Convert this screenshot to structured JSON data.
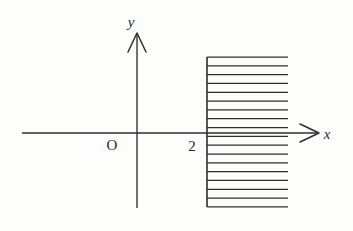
{
  "figure": {
    "background_color": "#fdfdfc",
    "ink_color": "#2e2e2e"
  },
  "labels": {
    "x_axis": "x",
    "y_axis": "y",
    "origin": "O",
    "x_intercept": "2"
  },
  "chart_data": {
    "type": "line",
    "title": "",
    "subtitle": "",
    "xlabel": "x",
    "ylabel": "y",
    "grid": false,
    "legend": null,
    "xlim": [
      -6,
      10
    ],
    "ylim": [
      -5,
      6
    ],
    "annotations": [
      {
        "text": "O",
        "x": -0.8,
        "y": -0.7,
        "role": "origin-label"
      },
      {
        "text": "2",
        "x": 1.5,
        "y": -0.6,
        "role": "x-intercept-label"
      },
      {
        "text": "x",
        "x": 9.4,
        "y": 0.55,
        "role": "x-axis-label"
      },
      {
        "text": "y",
        "x": -0.3,
        "y": 5.6,
        "role": "y-axis-label"
      }
    ],
    "axes": [
      {
        "name": "x-axis",
        "from": [
          -6.0,
          0
        ],
        "to": [
          9.0,
          0
        ],
        "arrow": "end"
      },
      {
        "name": "y-axis",
        "from": [
          0,
          -4.3
        ],
        "to": [
          0,
          5.2
        ],
        "arrow": "end"
      }
    ],
    "shaded_region": {
      "description": "Half-plane x greater than or equal to 2, drawn with horizontal hatch lines",
      "boundary": "x = 2",
      "boundary_style": "solid",
      "inequality": "x >= 2",
      "hatch_orientation": "horizontal",
      "hatch_line_count": 18,
      "hatch_spacing_px": 8.8,
      "x_start": 2,
      "x_end": 7.4,
      "y_top": 4.6,
      "y_bottom": -4.2
    }
  },
  "geometry": {
    "x_axis": {
      "x1": 22,
      "y1": 133,
      "x2": 318,
      "y2": 133
    },
    "y_axis": {
      "x1": 137,
      "y1": 208,
      "x2": 137,
      "y2": 33
    },
    "region_edge": {
      "x": 207,
      "y_top": 57,
      "y_bottom": 207
    },
    "hatch": {
      "x_start": 207,
      "x_end": 288,
      "y_first": 57,
      "spacing": 8.82,
      "count": 18
    },
    "label_positions": {
      "x": {
        "x": 327,
        "y": 139
      },
      "y": {
        "x": 131,
        "y": 27
      },
      "origin": {
        "x": 112,
        "y": 150
      },
      "x_intercept": {
        "x": 192,
        "y": 151
      }
    }
  }
}
